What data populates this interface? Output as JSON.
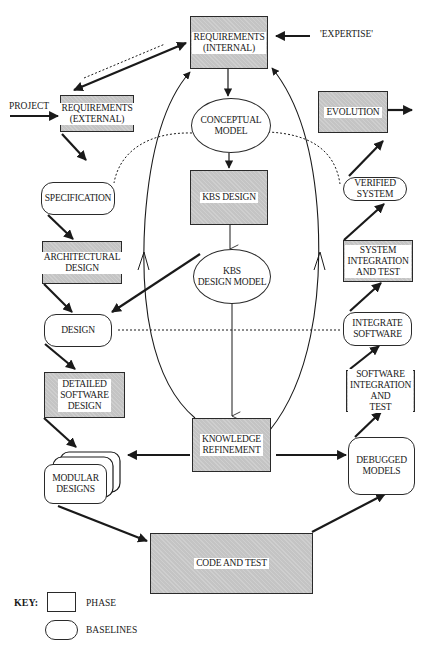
{
  "diagram": {
    "nodes": {
      "req_internal": {
        "label": "REQUIREMENTS\n(INTERNAL)",
        "type": "phase"
      },
      "req_external": {
        "label": "REQUIREMENTS\n(EXTERNAL)",
        "type": "phase"
      },
      "conceptual_model": {
        "label": "CONCEPTUAL\nMODEL",
        "type": "model"
      },
      "evolution": {
        "label": "EVOLUTION",
        "type": "phase"
      },
      "specification": {
        "label": "SPECIFICATION",
        "type": "baseline"
      },
      "kbs_design": {
        "label": "KBS DESIGN",
        "type": "phase"
      },
      "verified_system": {
        "label": "VERIFIED\nSYSTEM",
        "type": "baseline"
      },
      "architectural_design": {
        "label": "ARCHITECTURAL\nDESIGN",
        "type": "phase"
      },
      "kbs_design_model": {
        "label": "KBS\nDESIGN MODEL",
        "type": "model"
      },
      "system_integration": {
        "label": "SYSTEM\nINTEGRATION\nAND TEST",
        "type": "phase"
      },
      "design": {
        "label": "DESIGN",
        "type": "baseline"
      },
      "integrate_software": {
        "label": "INTEGRATE\nSOFTWARE",
        "type": "baseline"
      },
      "detailed_software_design": {
        "label": "DETAILED\nSOFTWARE\nDESIGN",
        "type": "phase"
      },
      "software_integration": {
        "label": "SOFTWARE\nINTEGRATION\nAND\nTEST",
        "type": "phase"
      },
      "knowledge_refinement": {
        "label": "KNOWLEDGE\nREFINEMENT",
        "type": "phase"
      },
      "modular_designs": {
        "label": "MODULAR\nDESIGNS",
        "type": "baseline"
      },
      "debugged_models": {
        "label": "DEBUGGED\nMODELS",
        "type": "baseline"
      },
      "code_and_test": {
        "label": "CODE AND TEST",
        "type": "phase"
      }
    },
    "inputs": {
      "project": "PROJECT",
      "expertise": "'EXPERTISE'"
    },
    "key": {
      "title": "KEY:",
      "phase_label": "PHASE",
      "baselines_label": "BASELINES"
    },
    "colors": {
      "phase_fill": "#c4c4c4",
      "stroke": "#1a1a1a",
      "background": "#ffffff"
    }
  }
}
